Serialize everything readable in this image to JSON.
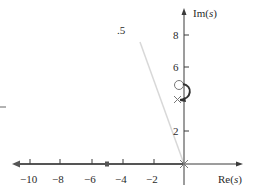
{
  "diagram": {
    "type": "root-locus",
    "axes": {
      "real_label_prefix": "Re(",
      "real_label_var": "s",
      "real_label_suffix": ")",
      "imag_label_prefix": "Im(",
      "imag_label_var": "s",
      "imag_label_suffix": ")",
      "real_ticks": [
        "−10",
        "−8",
        "−6",
        "−4",
        "−2"
      ],
      "imag_ticks": [
        "8",
        "6",
        "2"
      ]
    },
    "damping_line_label": ".5",
    "markers": {
      "zero": {
        "symbol": "circle",
        "re": 0,
        "im": 5
      },
      "pole_origin": {
        "symbol": "x",
        "re": 0,
        "im": 0
      },
      "pole_complex": {
        "symbol": "x",
        "re": 0,
        "im": 4
      }
    },
    "colors": {
      "axis": "#3a3a3a",
      "locus": "#555555",
      "damping_line": "#d8d8d8",
      "text": "#2a2a2a"
    }
  }
}
